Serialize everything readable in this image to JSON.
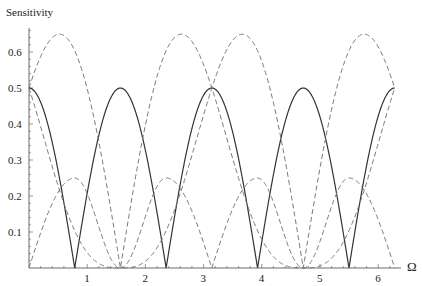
{
  "chart_data": {
    "type": "line",
    "title": "",
    "xlabel": "Ω",
    "ylabel": "Sensitivity",
    "xlim": [
      0,
      6.2832
    ],
    "ylim": [
      0,
      0.66
    ],
    "grid": false,
    "legend": null,
    "x_ticks": [
      "1",
      "2",
      "3",
      "4",
      "5",
      "6"
    ],
    "y_ticks": [
      "0.1",
      "0.2",
      "0.3",
      "0.4",
      "0.5",
      "0.6"
    ],
    "x": [
      0,
      0.2618,
      0.5236,
      0.7854,
      1.0472,
      1.309,
      1.5708,
      1.8326,
      2.0944,
      2.3562,
      2.618,
      2.8798,
      3.1416,
      3.4034,
      3.6652,
      3.927,
      4.1888,
      4.4506,
      4.7124,
      4.9742,
      5.236,
      5.4978,
      5.7596,
      6.0214,
      6.2832
    ],
    "series": [
      {
        "name": "solid",
        "style": "solid",
        "values": [
          0.5,
          0.433,
          0.25,
          0.0,
          0.25,
          0.433,
          0.5,
          0.433,
          0.25,
          0.0,
          0.25,
          0.433,
          0.5,
          0.433,
          0.25,
          0.0,
          0.25,
          0.433,
          0.5,
          0.433,
          0.25,
          0.0,
          0.25,
          0.433,
          0.5
        ]
      },
      {
        "name": "dashed-a",
        "style": "dashed",
        "values": [
          0.5,
          0.608,
          0.65,
          0.604,
          0.467,
          0.254,
          0.0,
          0.254,
          0.467,
          0.604,
          0.65,
          0.608,
          0.5,
          0.358,
          0.217,
          0.104,
          0.033,
          0.004,
          0.0,
          0.004,
          0.033,
          0.104,
          0.217,
          0.358,
          0.5
        ]
      },
      {
        "name": "dashed-b",
        "style": "dashed",
        "values": [
          0.5,
          0.358,
          0.217,
          0.104,
          0.033,
          0.004,
          0.0,
          0.004,
          0.033,
          0.104,
          0.217,
          0.358,
          0.5,
          0.608,
          0.65,
          0.604,
          0.467,
          0.254,
          0.0,
          0.254,
          0.467,
          0.604,
          0.65,
          0.608,
          0.5
        ]
      },
      {
        "name": "dashed-c",
        "style": "dashed",
        "values": [
          0.0,
          0.125,
          0.217,
          0.25,
          0.163,
          0.063,
          0.0,
          0.063,
          0.163,
          0.25,
          0.217,
          0.125,
          0.0,
          0.125,
          0.217,
          0.25,
          0.163,
          0.063,
          0.0,
          0.063,
          0.163,
          0.25,
          0.217,
          0.125,
          0.0
        ]
      }
    ]
  }
}
